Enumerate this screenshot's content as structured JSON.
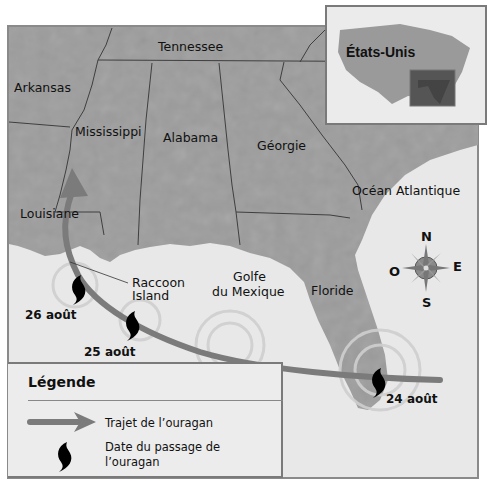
{
  "map": {
    "colors": {
      "land": "#9a9a9a",
      "land_dark": "#8a8a8a",
      "water": "#e6e6e6",
      "border": "#4a4a4a",
      "track": "#7b7b7b",
      "frame": "#7a7a7a",
      "inset_highlight": "#555555"
    },
    "states": [
      {
        "name": "Tennessee"
      },
      {
        "name": "Arkansas"
      },
      {
        "name": "Mississippi"
      },
      {
        "name": "Alabama"
      },
      {
        "name": "Géorgie"
      },
      {
        "name": "Louisiane"
      },
      {
        "name": "Floride"
      }
    ],
    "water_labels": {
      "gulf_line1": "Golfe",
      "gulf_line2": "du Mexique",
      "ocean": "Océan Atlantique"
    },
    "places": {
      "raccoon_line1": "Raccoon",
      "raccoon_line2": "Island"
    },
    "hurricane_dates": [
      {
        "label": "24 août"
      },
      {
        "label": "25 août"
      },
      {
        "label": "26 août"
      }
    ],
    "compass": {
      "n": "N",
      "s": "S",
      "e": "E",
      "w": "O"
    },
    "inset": {
      "title": "États-Unis"
    }
  },
  "legend": {
    "title": "Légende",
    "items": [
      {
        "icon": "arrow-icon",
        "label": "Trajet de l’ouragan"
      },
      {
        "icon": "hurricane-icon",
        "label": "Date du passage de l’ouragan"
      }
    ]
  }
}
